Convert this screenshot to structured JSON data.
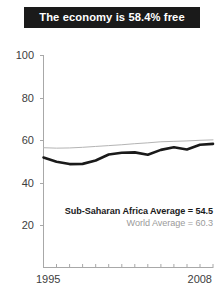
{
  "title": {
    "text": "The economy is 58.4% free"
  },
  "legend": {
    "primary": "Sub-Saharan Africa Average = 54.5",
    "secondary": "World Average = 60.3"
  },
  "axis": {
    "y_ticks": [
      "100",
      "80",
      "60",
      "40",
      "20"
    ],
    "x_start": "1995",
    "x_end": "2008"
  },
  "colors": {
    "banner_bg": "#1a1a1a",
    "banner_text": "#ffffff",
    "primary_line": "#1a1a1a",
    "secondary_line": "#b4b4b4",
    "axis": "#a8a8a8",
    "tick_text": "#3d3d3d"
  },
  "chart_data": {
    "type": "line",
    "title": "The economy is 58.4% free",
    "xlabel": "",
    "ylabel": "",
    "xlim": [
      1995,
      2008
    ],
    "ylim": [
      0,
      100
    ],
    "yticks": [
      20,
      40,
      60,
      80,
      100
    ],
    "xticks": [
      1995,
      1996,
      1997,
      1998,
      1999,
      2000,
      2001,
      2002,
      2003,
      2004,
      2005,
      2006,
      2007,
      2008
    ],
    "grid": false,
    "legend_position": "inside-bottom-right",
    "x": [
      1995,
      1996,
      1997,
      1998,
      1999,
      2000,
      2001,
      2002,
      2003,
      2004,
      2005,
      2006,
      2007,
      2008
    ],
    "series": [
      {
        "name": "Sub-Saharan Africa Average",
        "annotation": "Sub-Saharan Africa Average = 54.5",
        "color": "#1a1a1a",
        "linewidth": 2.6,
        "values": [
          52.0,
          50.0,
          48.9,
          49.0,
          50.6,
          53.4,
          54.2,
          54.4,
          53.3,
          55.6,
          56.8,
          55.8,
          58.0,
          58.4
        ]
      },
      {
        "name": "World Average",
        "annotation": "World Average = 60.3",
        "color": "#b4b4b4",
        "linewidth": 1.0,
        "values": [
          56.6,
          56.4,
          56.5,
          56.8,
          57.2,
          57.6,
          58.0,
          58.5,
          58.9,
          59.4,
          59.6,
          59.8,
          60.1,
          60.3
        ]
      }
    ]
  }
}
